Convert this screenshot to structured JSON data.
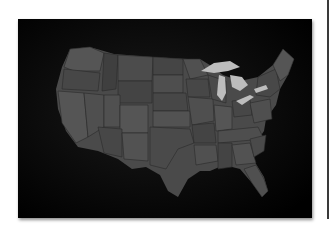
{
  "image": {
    "subject": "Map of the contiguous United States",
    "alt": "Dark photograph of a grey map of the contiguous United States with Great Lakes highlighted in light grey",
    "colors": {
      "background": "#050505",
      "state_fill_dark": "#3c3c3c",
      "state_fill_mid": "#4a4a4a",
      "state_fill_light": "#575757",
      "lakes": "#bdbdbd",
      "page": "#ffffff",
      "divider": "#3a3a3a"
    }
  }
}
